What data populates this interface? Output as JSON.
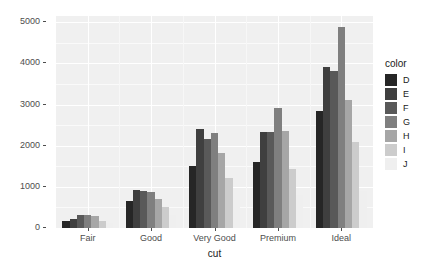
{
  "chart_data": {
    "type": "bar",
    "title": "",
    "subtitle": "",
    "xlabel": "cut",
    "ylabel": "count",
    "categories": [
      "Fair",
      "Good",
      "Very Good",
      "Premium",
      "Ideal"
    ],
    "legend_title": "color",
    "legend_position": "right",
    "grid": true,
    "ylim": [
      0,
      5150
    ],
    "yticks": [
      0,
      1000,
      2000,
      3000,
      4000,
      5000
    ],
    "ytick_labels": [
      "0",
      "1000",
      "2000",
      "3000",
      "4000",
      "5000"
    ],
    "bar_mode": "grouped",
    "series": [
      {
        "name": "D",
        "color": "#262626",
        "values": [
          163,
          662,
          1513,
          1603,
          2834
        ]
      },
      {
        "name": "E",
        "color": "#3f3f3f",
        "values": [
          224,
          933,
          2400,
          2337,
          3903
        ]
      },
      {
        "name": "F",
        "color": "#595959",
        "values": [
          312,
          909,
          2164,
          2331,
          3826
        ]
      },
      {
        "name": "G",
        "color": "#7f7f7f",
        "values": [
          314,
          871,
          2299,
          2924,
          4884
        ]
      },
      {
        "name": "H",
        "color": "#a6a6a6",
        "values": [
          303,
          702,
          1824,
          2360,
          3115
        ]
      },
      {
        "name": "I",
        "color": "#cccccc",
        "values": [
          175,
          522,
          1204,
          1428,
          2093
        ]
      },
      {
        "name": "J",
        "color": "#efefef",
        "values": [
          119,
          307,
          678,
          808,
          896
        ]
      }
    ],
    "panel_background": "#f0f0f0",
    "gridline_color": "#ffffff",
    "axis_text_color": "#4d4d4d"
  }
}
